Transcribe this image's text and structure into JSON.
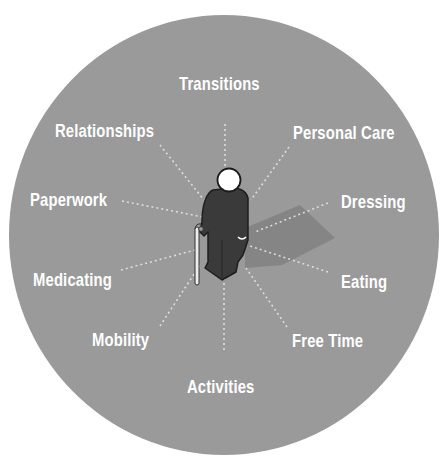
{
  "diagram": {
    "type": "radial",
    "center_figure": "elderly-person-with-cane",
    "colors": {
      "disk": "#9a9a9a",
      "label_text": "#ffffff",
      "figure": "#3a3a3a",
      "head": "#ffffff",
      "spokes": "#d8d8d8"
    },
    "labels": {
      "transitions": "Transitions",
      "personal_care": "Personal Care",
      "dressing": "Dressing",
      "eating": "Eating",
      "free_time": "Free Time",
      "activities": "Activities",
      "mobility": "Mobility",
      "medicating": "Medicating",
      "paperwork": "Paperwork",
      "relationships": "Relationships"
    }
  }
}
